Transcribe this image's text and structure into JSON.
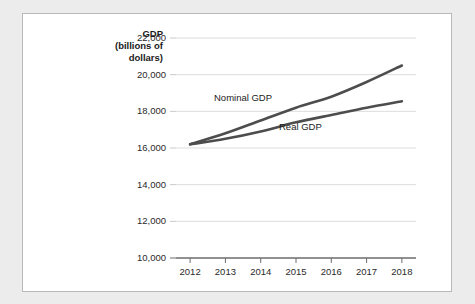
{
  "figure": {
    "background_color": "#ececec",
    "panel_color": "#ffffff",
    "panel_border_color": "#b9b9b9"
  },
  "axis_title": {
    "line1_bold": "GDP",
    "line2": "(billions of",
    "line3": "dollars)"
  },
  "chart_data": {
    "type": "line",
    "title": "",
    "xlabel": "",
    "ylabel": "GDP (billions of dollars)",
    "categories": [
      "2012",
      "2013",
      "2014",
      "2015",
      "2016",
      "2017",
      "2018"
    ],
    "x": [
      2012,
      2013,
      2014,
      2015,
      2016,
      2017,
      2018
    ],
    "xlim": [
      2011.6,
      2018.4
    ],
    "ylim": [
      10000,
      22000
    ],
    "ytick_labels": [
      "10,000",
      "12,000",
      "14,000",
      "16,000",
      "18,000",
      "20,000",
      "22,000"
    ],
    "yticks": [
      10000,
      12000,
      14000,
      16000,
      18000,
      20000,
      22000
    ],
    "grid": "horizontal",
    "legend": "inline-labels",
    "series": [
      {
        "name": "Nominal GDP",
        "color": "#4d4d4d",
        "label_text": "Nominal GDP",
        "values": [
          16200,
          16800,
          17500,
          18200,
          18800,
          19600,
          20500
        ]
      },
      {
        "name": "Real GDP",
        "color": "#4d4d4d",
        "label_text": "Real GDP",
        "values": [
          16200,
          16500,
          16900,
          17400,
          17800,
          18200,
          18550
        ]
      }
    ]
  }
}
